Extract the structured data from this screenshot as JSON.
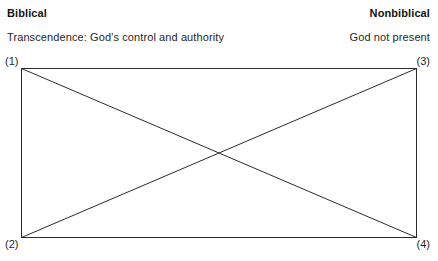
{
  "header": {
    "left_title": "Biblical",
    "right_title": "Nonbiblical",
    "left_subtitle": "Transcendence: God’s control and authority",
    "right_subtitle": "God not present"
  },
  "corners": {
    "top_left": "(1)",
    "top_right": "(3)",
    "bottom_left": "(2)",
    "bottom_right": "(4)"
  },
  "colors": {
    "line": "#2b2b2b",
    "text": "#1f1f1f",
    "background": "#ffffff"
  },
  "diagram": {
    "shape": "rectangle-with-crossed-diagonals",
    "rect": {
      "x": 21,
      "y": 68,
      "width": 396,
      "height": 170
    },
    "diagonals": [
      {
        "from": "top_left",
        "to": "bottom_right"
      },
      {
        "from": "bottom_left",
        "to": "top_right"
      }
    ],
    "intersection": {
      "x": 219,
      "y": 153
    }
  }
}
